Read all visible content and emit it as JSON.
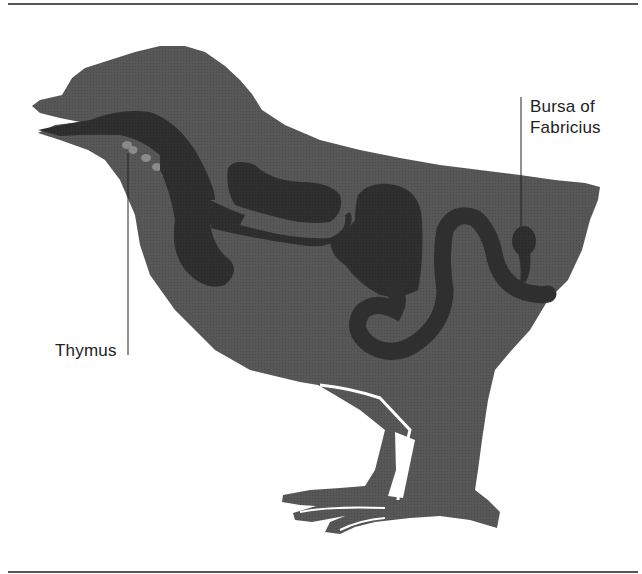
{
  "figure": {
    "labels": {
      "bursa": [
        "Bursa of",
        "Fabricius"
      ],
      "thymus": "Thymus"
    },
    "colors": {
      "body": "#565656",
      "organs": "#2e2e2e",
      "thymus_lobes": "#8a8a8a",
      "background": "#ffffff",
      "rule": "#555555",
      "text": "#222222"
    }
  }
}
